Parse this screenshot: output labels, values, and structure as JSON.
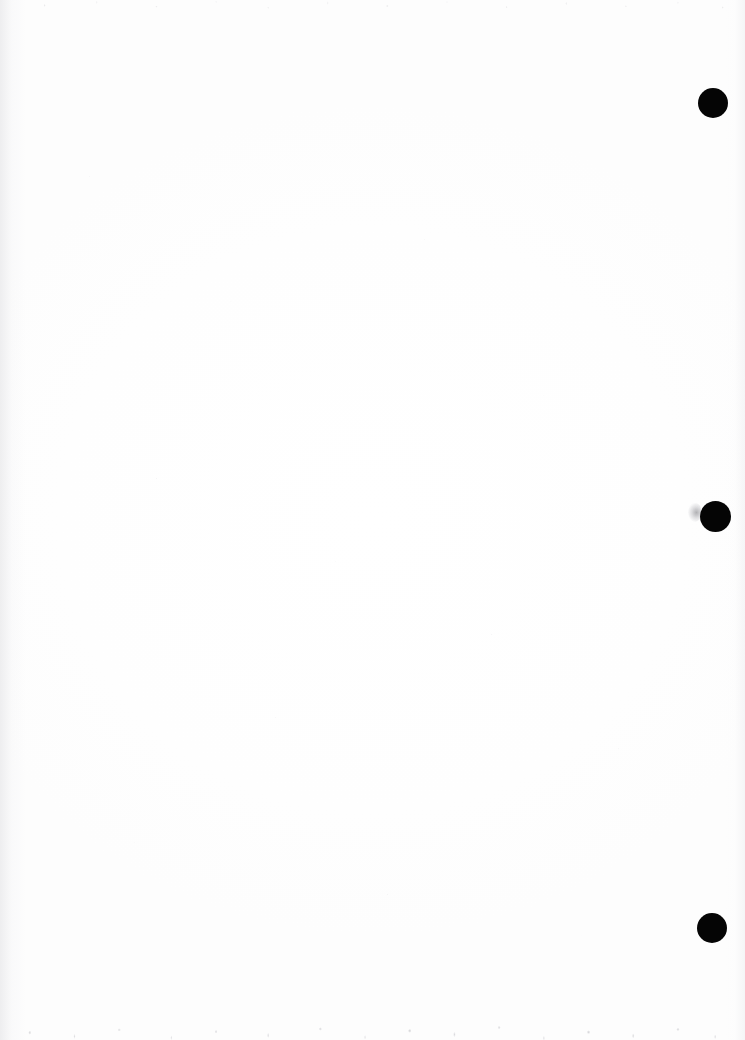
{
  "document": {
    "kind": "scanned-blank-page",
    "orientation": "portrait",
    "page_width": 745,
    "page_height": 1040,
    "background_color": "#fefefe",
    "visible_text": "",
    "text_note": "No text, headings, figures, tables or captions are present on this page."
  },
  "marks": {
    "label": "registration-dots",
    "shape": "filled-circle",
    "color": "#050505",
    "count": 3,
    "placement": "right margin, vertically spaced",
    "items": [
      {
        "name": "registration-dot-top",
        "cx": 713,
        "cy": 103,
        "diameter": 30
      },
      {
        "name": "registration-dot-middle",
        "cx": 715,
        "cy": 516,
        "diameter": 31
      },
      {
        "name": "registration-dot-bottom",
        "cx": 712,
        "cy": 928,
        "diameter": 30
      }
    ]
  },
  "artifacts": {
    "smudge": {
      "name": "scan-smudge",
      "color": "#8a8a90",
      "x": 688,
      "y": 503,
      "width": 13,
      "height": 19,
      "description": "faint gray speckled smudge left of the middle dot"
    },
    "noise": {
      "top_edge": {
        "name": "scan-noise-top",
        "height": 30,
        "color": "#cdcdd2"
      },
      "bottom_edge": {
        "name": "scan-noise-bottom",
        "height": 46,
        "color": "#b4b4ba"
      },
      "left_edge": {
        "name": "scan-edge-wash-left",
        "width": 26,
        "color": "#e1e1e4"
      },
      "right_edge": {
        "name": "scan-edge-wash-right",
        "width": 20,
        "color": "#e8e8eb"
      }
    }
  }
}
